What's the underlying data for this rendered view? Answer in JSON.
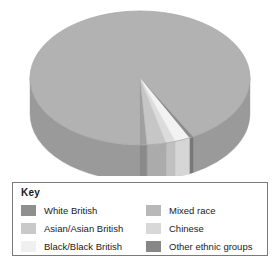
{
  "figure": {
    "type": "pie-3d",
    "background": "#ffffff"
  },
  "legend": {
    "title": "Key",
    "border_color": "#7a7a7a",
    "columns": [
      {
        "items": [
          {
            "label": "White British",
            "color": "#8f8f8f"
          },
          {
            "label": "Asian/Asian British",
            "color": "#c9c9c9"
          },
          {
            "label": "Black/Black British",
            "color": "#f0f0f0"
          }
        ]
      },
      {
        "items": [
          {
            "label": "Mixed race",
            "color": "#b8b8b8"
          },
          {
            "label": "Chinese",
            "color": "#d8d8d8"
          },
          {
            "label": "Other ethnic groups",
            "color": "#878787"
          }
        ]
      }
    ]
  },
  "chart_data": {
    "type": "pie",
    "title": "",
    "labels": [
      "White British",
      "Mixed race",
      "Black/Black British",
      "Chinese",
      "Asian/Asian British",
      "Other ethnic groups"
    ],
    "values": [
      92,
      0.6,
      2.2,
      1.4,
      2.8,
      1.0
    ],
    "unit": "%",
    "colors": [
      "#b2b2b2",
      "#8c8c8c",
      "#f2f2f2",
      "#dcdcdc",
      "#c6c6c6",
      "#a0a0a0"
    ],
    "side_colors": [
      "#9a9a9a",
      "#787878",
      "#d6d6d6",
      "#c0c0c0",
      "#ababab",
      "#8a8a8a"
    ],
    "legend_position": "below",
    "three_d": true,
    "start_angle_deg": 90,
    "direction": "clockwise"
  }
}
